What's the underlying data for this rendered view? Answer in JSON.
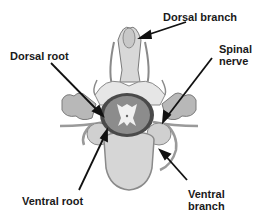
{
  "diagram": {
    "colors": {
      "background": "#ffffff",
      "outline": "#6e6e6e",
      "bone_light": "#dcdcdc",
      "bone_mid": "#b4b4b4",
      "cord_outer": "#4a4a4a",
      "cord_white_matter": "#8c8c8c",
      "cord_grey_matter": "#f0f0f0",
      "vertebral_body": "#d6d6d6",
      "arrow": "#111111",
      "label_text": "#1a1a1a"
    },
    "labels": {
      "dorsal_branch": "Dorsal branch",
      "dorsal_root": "Dorsal root",
      "spinal_nerve": "Spinal\nnerve",
      "ventral_root": "Ventral root",
      "ventral_branch": "Ventral\nbranch"
    }
  }
}
